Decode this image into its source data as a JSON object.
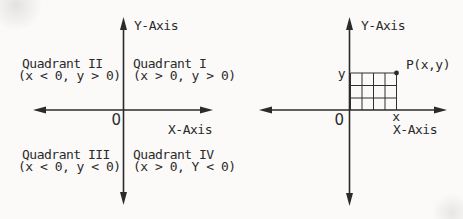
{
  "colors": {
    "ink": "#2b2b2b",
    "paper": "#fbfaf8"
  },
  "left_diagram": {
    "y_axis_label": "Y-Axis",
    "x_axis_label": "X-Axis",
    "origin_label": "0",
    "quadrants": [
      {
        "name": "Quadrant I",
        "condition": "(x > 0, y > 0)"
      },
      {
        "name": "Quadrant II",
        "condition": "(x < 0, y > 0)"
      },
      {
        "name": "Quadrant III",
        "condition": "(x < 0, y < 0)"
      },
      {
        "name": "Quadrant IV",
        "condition": "(x > 0, Y < 0)"
      }
    ]
  },
  "right_diagram": {
    "y_axis_label": "Y-Axis",
    "x_axis_label": "X-Axis",
    "origin_label": "0",
    "point_label": "P(x,y)",
    "x_value_label": "x",
    "y_value_label": "y",
    "grid": {
      "columns": 4,
      "rows": 3
    }
  }
}
